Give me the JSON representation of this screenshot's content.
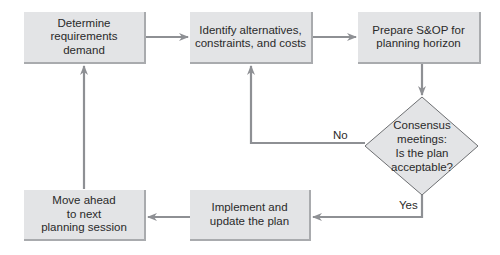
{
  "diagram": {
    "type": "flowchart",
    "colors": {
      "box_fill": "#e3e4e6",
      "arrow": "#8e9094",
      "text": "#2a2a2a"
    },
    "nodes": [
      {
        "id": "determine",
        "shape": "rect",
        "text": "Determine\nrequirements\ndemand"
      },
      {
        "id": "identify",
        "shape": "rect",
        "text": "Identify alternatives,\nconstraints, and costs"
      },
      {
        "id": "prepare",
        "shape": "rect",
        "text": "Prepare S&OP for\nplanning horizon"
      },
      {
        "id": "consensus",
        "shape": "diamond",
        "text": "Consensus\nmeetings:\nIs the plan\nacceptable?"
      },
      {
        "id": "implement",
        "shape": "rect",
        "text": "Implement and\nupdate the plan"
      },
      {
        "id": "move",
        "shape": "rect",
        "text": "Move ahead\nto next\nplanning session"
      }
    ],
    "edges": [
      {
        "from": "determine",
        "to": "identify",
        "label": ""
      },
      {
        "from": "identify",
        "to": "prepare",
        "label": ""
      },
      {
        "from": "prepare",
        "to": "consensus",
        "label": ""
      },
      {
        "from": "consensus",
        "to": "identify",
        "label": "No"
      },
      {
        "from": "consensus",
        "to": "implement",
        "label": "Yes"
      },
      {
        "from": "implement",
        "to": "move",
        "label": ""
      },
      {
        "from": "move",
        "to": "determine",
        "label": ""
      }
    ],
    "labels": {
      "no": "No",
      "yes": "Yes"
    }
  }
}
